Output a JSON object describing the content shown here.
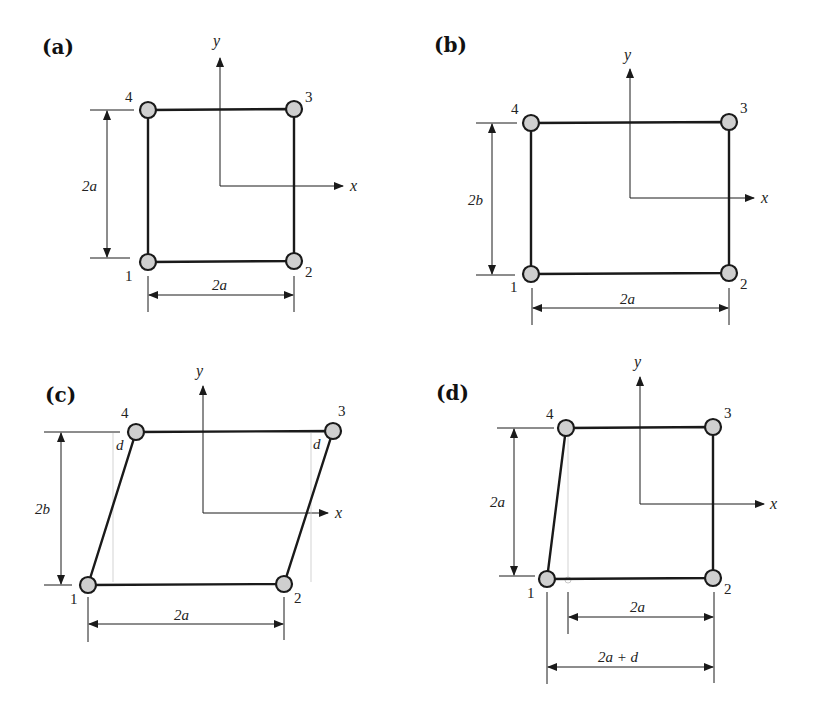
{
  "figure": {
    "panels": [
      {
        "id": "a",
        "label": "(a)",
        "axes": {
          "x": "x",
          "y": "y"
        },
        "nodes": [
          "1",
          "2",
          "3",
          "4"
        ],
        "dims": {
          "vertical": "2a",
          "horizontal": "2a"
        }
      },
      {
        "id": "b",
        "label": "(b)",
        "axes": {
          "x": "x",
          "y": "y"
        },
        "nodes": [
          "1",
          "2",
          "3",
          "4"
        ],
        "dims": {
          "vertical": "2b",
          "horizontal": "2a"
        }
      },
      {
        "id": "c",
        "label": "(c)",
        "axes": {
          "x": "x",
          "y": "y"
        },
        "nodes": [
          "1",
          "2",
          "3",
          "4"
        ],
        "dims": {
          "vertical": "2b",
          "horizontal": "2a",
          "offset_left": "d",
          "offset_right": "d"
        }
      },
      {
        "id": "d",
        "label": "(d)",
        "axes": {
          "x": "x",
          "y": "y"
        },
        "nodes": [
          "1",
          "2",
          "3",
          "4"
        ],
        "dims": {
          "vertical": "2a",
          "horizontal": "2a",
          "horizontal_total": "2a + d"
        }
      }
    ]
  }
}
